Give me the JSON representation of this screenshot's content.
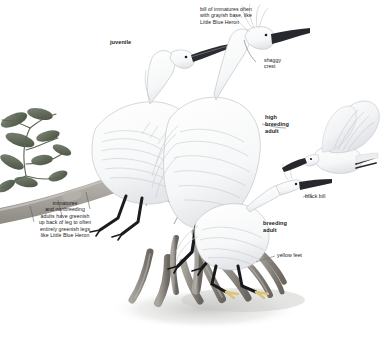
{
  "plate": {
    "title": "Snowy Egret plumage plate",
    "background_color": "#ffffff",
    "text_color": "#1c1c1c"
  },
  "annotations": [
    {
      "id": "bill-of-immatures",
      "text": "bill of immatures often\nwith grayish base, like\nLittle Blue Heron",
      "style": "regular",
      "align": "left"
    },
    {
      "id": "juvenile",
      "text": "juvenile",
      "style": "bold",
      "align": "left"
    },
    {
      "id": "shaggy-crest",
      "text": "shaggy\ncrest",
      "style": "regular",
      "align": "left"
    },
    {
      "id": "high-breeding-adult",
      "text": "high\nbreeding\nadult",
      "style": "bold",
      "align": "left"
    },
    {
      "id": "immatures-legs",
      "text": "immatures\nand nonbreeding\nadults have greenish\nup back of leg to often\nentirely greenish legs\nlike Little Blue Heron",
      "style": "regular",
      "align": "center"
    },
    {
      "id": "black-bill",
      "text": "black bill",
      "style": "regular",
      "align": "left"
    },
    {
      "id": "breeding-adult",
      "text": "breeding\nadult",
      "style": "bold",
      "align": "left"
    },
    {
      "id": "yellow-feet",
      "text": "yellow feet",
      "style": "regular",
      "align": "left"
    }
  ],
  "subjects": [
    {
      "id": "juvenile-egret",
      "label": "juvenile",
      "posture": "crouched on branch"
    },
    {
      "id": "high-breeding-adult-egret",
      "label": "high breeding adult",
      "posture": "upright on branch"
    },
    {
      "id": "breeding-adult-egret",
      "label": "breeding adult",
      "posture": "perched low on branch"
    },
    {
      "id": "flying-egret",
      "label": "egret in flight",
      "posture": "wings raised"
    }
  ],
  "scene": {
    "branch": "mangrove branch",
    "roots": "mangrove prop roots",
    "foliage": "mangrove leaves",
    "ground_shadow": "cast shadow"
  },
  "palette": {
    "plumage_white": "#fdfdfd",
    "plumage_shade": "#d8dade",
    "feather_line": "#b9bcc2",
    "bill_black": "#22242a",
    "leg_black": "#1b1c20",
    "foot_yellow": "#d9c477",
    "branch_gray": "#9a9690",
    "branch_dark": "#6f6b66",
    "leaf_green": "#6f7a6a",
    "leaf_dark": "#49513f",
    "shadow_gray": "#c9c9c7"
  }
}
